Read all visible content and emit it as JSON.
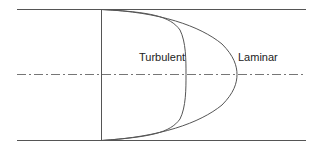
{
  "diagram": {
    "labels": {
      "turbulent": "Turbulent",
      "laminar": "Laminar"
    },
    "colors": {
      "line": "#555555",
      "text": "#222222",
      "background": "#ffffff"
    },
    "elements": [
      {
        "type": "pipe-wall",
        "position": "top"
      },
      {
        "type": "pipe-wall",
        "position": "bottom"
      },
      {
        "type": "centerline",
        "style": "dash-dot"
      },
      {
        "type": "reference-line",
        "orientation": "vertical"
      },
      {
        "type": "profile",
        "name": "Turbulent",
        "shape": "blunt"
      },
      {
        "type": "profile",
        "name": "Laminar",
        "shape": "parabolic"
      }
    ]
  }
}
